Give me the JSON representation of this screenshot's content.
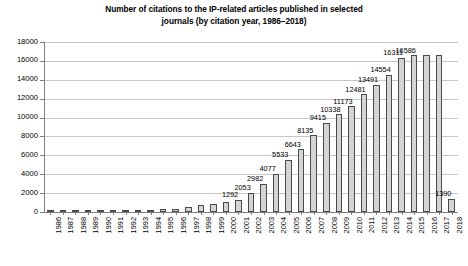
{
  "chart_data": {
    "type": "bar",
    "title": "Number of citations to the IP-related articles published in selected journals (by citation year, 1986–2018)",
    "title_line1": "Number of citations to the IP-related articles published in selected",
    "title_line2": "journals (by citation year, 1986–2018)",
    "xlabel": "",
    "ylabel": "",
    "ylim": [
      0,
      18000
    ],
    "ytick_step": 2000,
    "ytick_labels": [
      "0",
      "2000",
      "4000",
      "6000",
      "8000",
      "10000",
      "12000",
      "14000",
      "16000",
      "18000"
    ],
    "ytick_values": [
      0,
      2000,
      4000,
      6000,
      8000,
      10000,
      12000,
      14000,
      16000,
      18000
    ],
    "grid": true,
    "grid_axis": "y",
    "legend": null,
    "bar_fill_color": "#d4d4d4",
    "bar_edge_color": "#4a4a4a",
    "categories": [
      "1986",
      "1987",
      "1988",
      "1989",
      "1990",
      "1991",
      "1992",
      "1993",
      "1994",
      "1995",
      "1996",
      "1997",
      "1998",
      "1999",
      "2000",
      "2001",
      "2002",
      "2003",
      "2004",
      "2005",
      "2006",
      "2007",
      "2008",
      "2009",
      "2010",
      "2011",
      "2012",
      "2013",
      "2014",
      "2015",
      "2016",
      "2017",
      "2018"
    ],
    "values": [
      10,
      18,
      25,
      40,
      62,
      95,
      130,
      170,
      230,
      290,
      370,
      520,
      700,
      880,
      1020,
      1292,
      2053,
      2982,
      4077,
      5533,
      6643,
      8135,
      9415,
      10338,
      11173,
      12481,
      13491,
      14554,
      16311,
      16586,
      16586,
      16586,
      1390
    ],
    "point_labels": [
      "",
      "",
      "",
      "",
      "",
      "",
      "",
      "",
      "",
      "",
      "",
      "",
      "",
      "",
      "",
      "1292",
      "2053",
      "2982",
      "4077",
      "5533",
      "6643",
      "8135",
      "9415",
      "10338",
      "11173",
      "12481",
      "13491",
      "14554",
      "16311",
      "16586",
      "",
      "",
      "1390"
    ],
    "series": [
      {
        "name": "Citations",
        "points": [
          {
            "year": "1986",
            "value": 10,
            "label": ""
          },
          {
            "year": "1987",
            "value": 18,
            "label": ""
          },
          {
            "year": "1988",
            "value": 25,
            "label": ""
          },
          {
            "year": "1989",
            "value": 40,
            "label": ""
          },
          {
            "year": "1990",
            "value": 62,
            "label": ""
          },
          {
            "year": "1991",
            "value": 95,
            "label": ""
          },
          {
            "year": "1992",
            "value": 130,
            "label": ""
          },
          {
            "year": "1993",
            "value": 170,
            "label": ""
          },
          {
            "year": "1994",
            "value": 230,
            "label": ""
          },
          {
            "year": "1995",
            "value": 290,
            "label": ""
          },
          {
            "year": "1996",
            "value": 370,
            "label": ""
          },
          {
            "year": "1997",
            "value": 520,
            "label": ""
          },
          {
            "year": "1998",
            "value": 700,
            "label": ""
          },
          {
            "year": "1999",
            "value": 880,
            "label": ""
          },
          {
            "year": "2000",
            "value": 1020,
            "label": ""
          },
          {
            "year": "2001",
            "value": 1292,
            "label": "1292"
          },
          {
            "year": "2002",
            "value": 2053,
            "label": "2053"
          },
          {
            "year": "2003",
            "value": 2982,
            "label": "2982"
          },
          {
            "year": "2004",
            "value": 4077,
            "label": "4077"
          },
          {
            "year": "2005",
            "value": 5533,
            "label": "5533"
          },
          {
            "year": "2006",
            "value": 6643,
            "label": "6643"
          },
          {
            "year": "2007",
            "value": 8135,
            "label": "8135"
          },
          {
            "year": "2008",
            "value": 9415,
            "label": "9415"
          },
          {
            "year": "2009",
            "value": 10338,
            "label": "10338"
          },
          {
            "year": "2010",
            "value": 11173,
            "label": "11173"
          },
          {
            "year": "2011",
            "value": 12481,
            "label": "12481"
          },
          {
            "year": "2012",
            "value": 13491,
            "label": "13491"
          },
          {
            "year": "2013",
            "value": 14554,
            "label": "14554"
          },
          {
            "year": "2014",
            "value": 16311,
            "label": "16311"
          },
          {
            "year": "2015",
            "value": 16586,
            "label": "16586"
          },
          {
            "year": "2016",
            "value": 16586,
            "label": ""
          },
          {
            "year": "2017",
            "value": 16586,
            "label": ""
          },
          {
            "year": "2018",
            "value": 1390,
            "label": "1390"
          }
        ]
      }
    ]
  }
}
